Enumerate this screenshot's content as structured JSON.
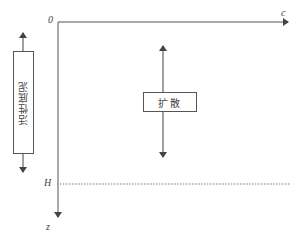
{
  "diagram": {
    "axes": {
      "origin_label": "0",
      "x_label": "c",
      "y_label": "z",
      "depth_marker_label": "H"
    },
    "boxes": {
      "active_sludge": {
        "label": "活性底泥"
      },
      "diffusion": {
        "label": "扩散"
      }
    },
    "colors": {
      "line": "#555555",
      "dotted": "#777777",
      "background": "#ffffff"
    }
  }
}
